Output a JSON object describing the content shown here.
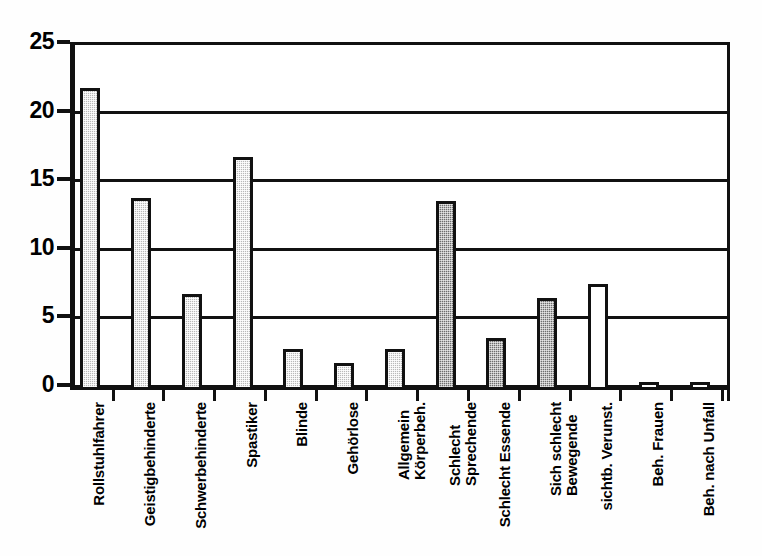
{
  "chart_data": {
    "type": "bar",
    "title": "",
    "subtitle": "",
    "xlabel": "",
    "ylabel": "",
    "ylim": [
      0,
      25
    ],
    "yticks": [
      0,
      5,
      10,
      15,
      20,
      25
    ],
    "grid": true,
    "legend": "none",
    "bar_style_note": "gray hatched bars; last three bars unfilled (white)",
    "categories": [
      "Rollstuhlfahrer",
      "Geistigbehinderte",
      "Schwerbehinderte",
      "Spastiker",
      "Blinde",
      "Gehörlose",
      "Allgemein Körperbeh.",
      "Schlecht Sprechende",
      "Schlecht Essende",
      "Sich schlecht Bewegende",
      "sichtb. Verunst.",
      "Beh. Frauen",
      "Beh. nach Unfall"
    ],
    "category_lines": [
      [
        "Rollstuhlfahrer"
      ],
      [
        "Geistigbehinderte"
      ],
      [
        "Schwerbehinderte"
      ],
      [
        "Spastiker"
      ],
      [
        "Blinde"
      ],
      [
        "Gehörlose"
      ],
      [
        "Allgemein",
        "Körperbeh."
      ],
      [
        "Schlecht",
        "Sprechende"
      ],
      [
        "Schlecht Essende"
      ],
      [
        "Sich schlecht",
        "Bewegende"
      ],
      [
        "sichtb. Verunst."
      ],
      [
        "Beh. Frauen"
      ],
      [
        "Beh. nach Unfall"
      ]
    ],
    "values": [
      22,
      14,
      7,
      17,
      3,
      2,
      3,
      13.8,
      3.8,
      6.7,
      7.7,
      0.6,
      0.6
    ],
    "fills": [
      "hatched",
      "hatched",
      "hatched",
      "hatched",
      "hatched",
      "hatched",
      "hatched",
      "dark",
      "dark",
      "dark",
      "white",
      "white",
      "white"
    ]
  },
  "axis": {
    "y_tick_labels": [
      "25",
      "20",
      "15",
      "10",
      "5",
      "0"
    ]
  }
}
